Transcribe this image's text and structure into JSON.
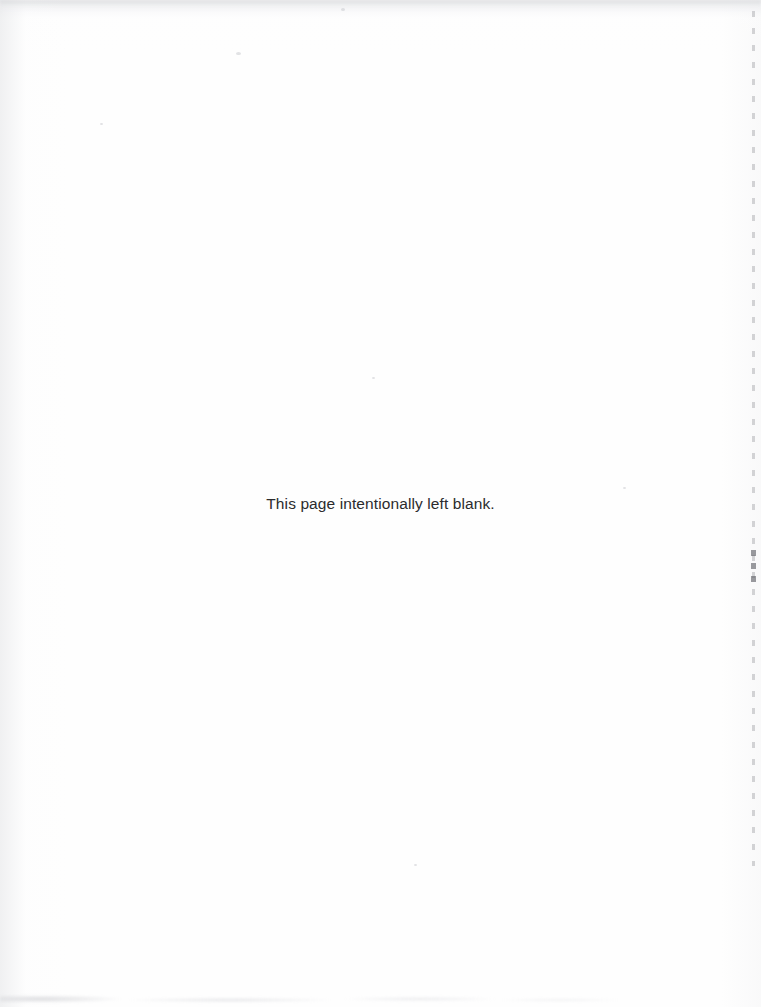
{
  "page": {
    "width": 761,
    "height": 1007,
    "background_color": "#fefefe",
    "text_color": "#2b2b2d",
    "notice_text": "This page intentionally left blank."
  },
  "artifacts": {
    "right_edge_line_label": "right-edge scan shadow",
    "top_band_label": "top-edge scan band",
    "bottom_band_label": "bottom-edge scan smudge",
    "speck_label": "scan speck"
  }
}
